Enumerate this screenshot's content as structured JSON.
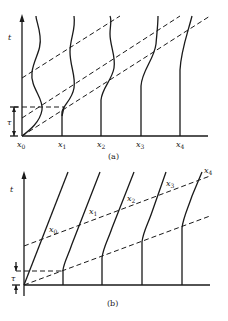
{
  "figure": {
    "panels": [
      {
        "id": "a",
        "caption": "(a)",
        "axis_label": "t",
        "interval_label": "τ",
        "positions": [
          {
            "name": "x",
            "sub": "0"
          },
          {
            "name": "x",
            "sub": "1"
          },
          {
            "name": "x",
            "sub": "2"
          },
          {
            "name": "x",
            "sub": "3"
          },
          {
            "name": "x",
            "sub": "4"
          }
        ],
        "description": "Worldlines of five positions with wavy (oscillating) trajectories; dashed diagonal lines indicate signal propagation"
      },
      {
        "id": "b",
        "caption": "(b)",
        "axis_label": "t",
        "interval_label": "τ",
        "positions": [
          {
            "name": "x",
            "sub": "0"
          },
          {
            "name": "x",
            "sub": "1"
          },
          {
            "name": "x",
            "sub": "2"
          },
          {
            "name": "x",
            "sub": "3"
          },
          {
            "name": "x",
            "sub": "4"
          }
        ],
        "description": "Worldlines that tilt after a delay; dashed diagonal lines mark propagation fronts"
      }
    ]
  }
}
